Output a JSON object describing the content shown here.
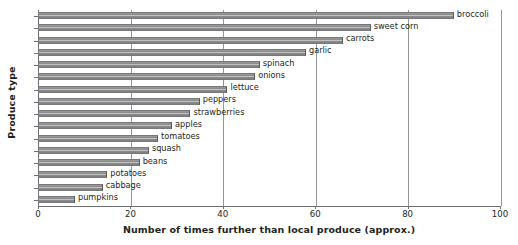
{
  "chart_data": {
    "type": "bar",
    "orientation": "horizontal",
    "title": "",
    "xlabel": "Number of times further than local produce (approx.)",
    "ylabel": "Produce type",
    "xlim": [
      0,
      100
    ],
    "xticks": [
      0,
      20,
      40,
      60,
      80,
      100
    ],
    "grid": true,
    "legend": null,
    "categories": [
      "broccoli",
      "sweet corn",
      "carrots",
      "garlic",
      "spinach",
      "onions",
      "lettuce",
      "peppers",
      "strawberries",
      "apples",
      "tomatoes",
      "squash",
      "beans",
      "potatoes",
      "cabbage",
      "pumpkins"
    ],
    "values": [
      90,
      72,
      66,
      58,
      48,
      47,
      41,
      35,
      33,
      29,
      26,
      24,
      22,
      15,
      14,
      8
    ],
    "bar_color": "#8c8c8c",
    "axis_color": "#6d6e71",
    "grid_color": "#939598"
  }
}
